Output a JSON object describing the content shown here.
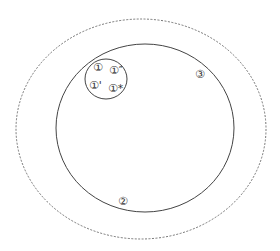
{
  "diagram": {
    "outer_region": {
      "style": "dashed",
      "color": "#555555"
    },
    "inner_region": {
      "style": "solid",
      "color": "#444444"
    },
    "cluster_region": {
      "style": "solid",
      "color": "#444444"
    },
    "labels": {
      "one": "①",
      "one_double_prime": "①″",
      "one_prime": "①'",
      "one_star": "①*",
      "two": "②",
      "three": "③"
    }
  }
}
